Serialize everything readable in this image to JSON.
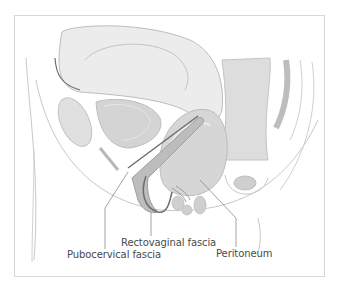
{
  "diagram": {
    "labels": [
      {
        "id": "rectovaginal",
        "text": "Rectovaginal fascia"
      },
      {
        "id": "pubocervical",
        "text": "Pubocervical fascia"
      },
      {
        "id": "peritoneum",
        "text": "Peritoneum"
      }
    ],
    "colors": {
      "frame": "#d6d6d6",
      "outline": "#b5b5b5",
      "tissue_light": "#ededed",
      "tissue_mid": "#d9d9d9",
      "tissue_dark": "#bdbdbd",
      "fascia_dark": "#6e6e6e",
      "leader_line": "#8a8a8a",
      "label_text": "#4a4a4a"
    }
  }
}
